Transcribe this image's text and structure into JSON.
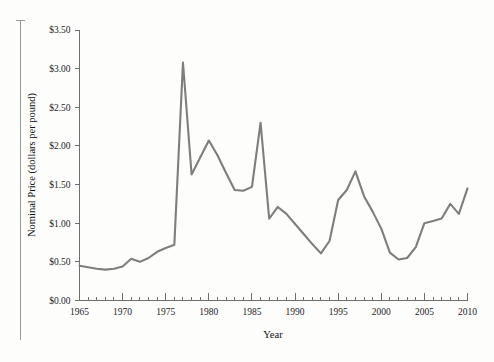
{
  "chart_data": {
    "type": "line",
    "title": "",
    "xlabel": "Year",
    "ylabel": "Nominal Price (dollars per pound)",
    "xlim": [
      1965,
      2010
    ],
    "ylim": [
      0.0,
      3.5
    ],
    "grid": false,
    "legend": null,
    "x_tick_labels": [
      "1965",
      "1970",
      "1975",
      "1980",
      "1985",
      "1990",
      "1995",
      "2000",
      "2005",
      "2010"
    ],
    "x_tick_values": [
      1965,
      1970,
      1975,
      1980,
      1985,
      1990,
      1995,
      2000,
      2005,
      2010
    ],
    "x_minor_tick_step": 1,
    "y_tick_labels": [
      "$0.00",
      "$0.50",
      "$1.00",
      "$1.50",
      "$2.00",
      "$2.50",
      "$3.00",
      "$3.50"
    ],
    "y_tick_values": [
      0.0,
      0.5,
      1.0,
      1.5,
      2.0,
      2.5,
      3.0,
      3.5
    ],
    "series": [
      {
        "name": "Nominal Price",
        "color": "#7e7e7e",
        "x": [
          1965,
          1966,
          1967,
          1968,
          1969,
          1970,
          1971,
          1972,
          1973,
          1974,
          1975,
          1976,
          1977,
          1978,
          1979,
          1980,
          1981,
          1982,
          1983,
          1984,
          1985,
          1986,
          1987,
          1988,
          1989,
          1990,
          1991,
          1992,
          1993,
          1994,
          1995,
          1996,
          1997,
          1998,
          1999,
          2000,
          2001,
          2002,
          2003,
          2004,
          2005,
          2006,
          2007,
          2008,
          2009,
          2010
        ],
        "y": [
          0.45,
          0.43,
          0.41,
          0.4,
          0.41,
          0.44,
          0.54,
          0.5,
          0.55,
          0.63,
          0.68,
          0.72,
          3.08,
          1.63,
          1.85,
          2.07,
          1.88,
          1.65,
          1.43,
          1.42,
          1.47,
          2.3,
          1.06,
          1.21,
          1.12,
          0.99,
          0.86,
          0.73,
          0.61,
          0.77,
          1.3,
          1.43,
          1.67,
          1.35,
          1.15,
          0.93,
          0.62,
          0.53,
          0.55,
          0.69,
          1.0,
          1.03,
          1.06,
          1.25,
          1.12,
          1.45
        ]
      }
    ]
  },
  "axes": {
    "x_title": "Year",
    "y_title": "Nominal Price (dollars per pound)"
  },
  "decorations": {
    "left_rule": "vertical-rule"
  }
}
